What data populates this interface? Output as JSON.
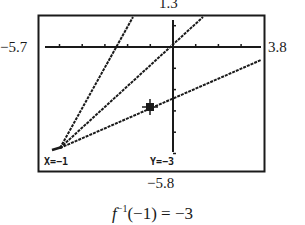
{
  "window": {
    "ymax_label": "1.3",
    "ymin_label": "−5.8",
    "xmin_label": "−5.7",
    "xmax_label": "3.8"
  },
  "screen": {
    "trace_x_label": "X=−1",
    "trace_y_label": "Y=−3"
  },
  "caption": {
    "function": "f",
    "superscript": "−1",
    "rest": "(−1) = −3"
  },
  "colors": {
    "ink": "#1a1a1a",
    "background": "#ffffff"
  },
  "chart_data": {
    "type": "line",
    "title": "",
    "xlabel": "",
    "ylabel": "",
    "xlim": [
      -5.7,
      3.8
    ],
    "ylim": [
      -5.8,
      1.3
    ],
    "grid": false,
    "axis_ticks": "unit ticks on both axes",
    "series": [
      {
        "name": "f(x) (steep line)",
        "x": [
          -5.0,
          -1.2
        ],
        "y": [
          -4.4,
          1.3
        ]
      },
      {
        "name": "y = x",
        "x": [
          -5.0,
          1.3
        ],
        "y": [
          -5.0,
          1.3
        ]
      },
      {
        "name": "f⁻¹(x) (shallow line)",
        "x": [
          -5.0,
          3.8
        ],
        "y": [
          -5.0,
          -1.0
        ]
      }
    ],
    "annotations": [
      {
        "type": "trace-cursor",
        "series": "f⁻¹(x) (shallow line)",
        "x": -1,
        "y": -3,
        "label": "X=−1  Y=−3"
      },
      {
        "type": "caption",
        "text": "f⁻¹(−1) = −3"
      }
    ]
  }
}
